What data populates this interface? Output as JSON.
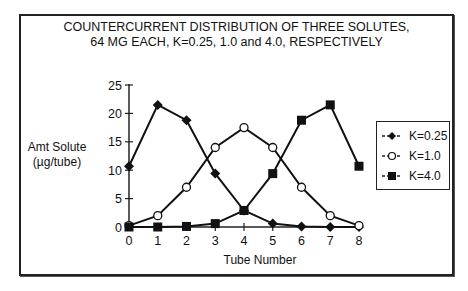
{
  "chart_data": {
    "type": "line",
    "title": [
      "COUNTERCURRENT DISTRIBUTION OF THREE SOLUTES,",
      "64 MG EACH,  K=0.25, 1.0 and 4.0, RESPECTIVELY"
    ],
    "xlabel": "Tube Number",
    "ylabel": [
      "Amt Solute",
      "(µg/tube)"
    ],
    "x": [
      0,
      1,
      2,
      3,
      4,
      5,
      6,
      7,
      8
    ],
    "x_ticks": [
      "0",
      "1",
      "2",
      "3",
      "4",
      "5",
      "6",
      "7",
      "8"
    ],
    "y_ticks": [
      "0",
      "5",
      "10",
      "15",
      "20",
      "25"
    ],
    "ylim": [
      0,
      25
    ],
    "xlim": [
      0,
      8
    ],
    "grid": false,
    "legend_position": "right",
    "series": [
      {
        "name": "K=0.25",
        "marker": "filled-diamond",
        "values": [
          10.7,
          21.5,
          18.8,
          9.4,
          2.9,
          0.6,
          0.1,
          0.0,
          0.0
        ]
      },
      {
        "name": "K=1.0",
        "marker": "open-circle",
        "values": [
          0.25,
          2.0,
          7.0,
          14.0,
          17.5,
          14.0,
          7.0,
          2.0,
          0.25
        ]
      },
      {
        "name": "K=4.0",
        "marker": "filled-square",
        "values": [
          0.0,
          0.0,
          0.1,
          0.6,
          2.9,
          9.4,
          18.8,
          21.5,
          10.7
        ]
      }
    ]
  },
  "labels": {
    "title_line1": "COUNTERCURRENT DISTRIBUTION OF THREE SOLUTES,",
    "title_line2": "64 MG EACH,  K=0.25, 1.0 and 4.0, RESPECTIVELY",
    "ylabel_line1": "Amt Solute",
    "ylabel_line2": "(µg/tube)",
    "xlabel": "Tube Number",
    "legend": [
      "K=0.25",
      "K=1.0",
      "K=4.0"
    ]
  }
}
